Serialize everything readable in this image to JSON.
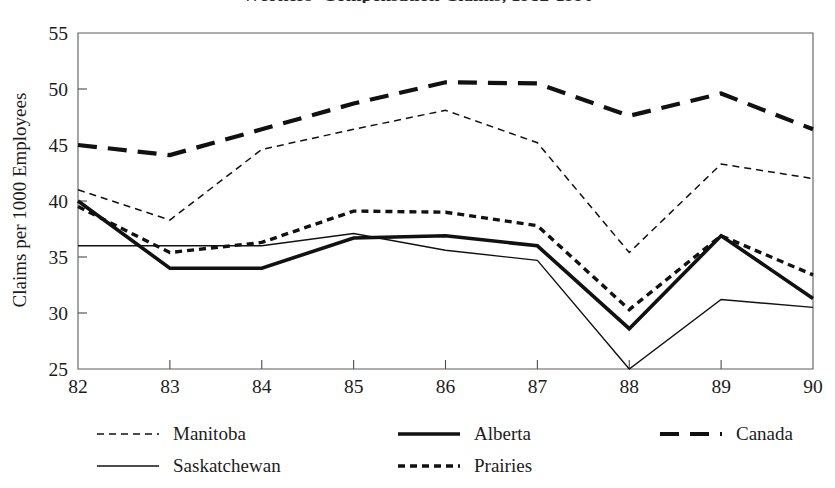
{
  "figure": {
    "title": "Workers' Compensation Claims, 1982-1990",
    "title_visible": "partially cropped at top edge",
    "background_color": "#ffffff",
    "ink_color": "#111111"
  },
  "axes": {
    "y_axis_title": "Claims per 1000 Employees",
    "y_ticks": [
      "25",
      "30",
      "35",
      "40",
      "45",
      "50",
      "55"
    ],
    "y_min": 25,
    "y_max": 55,
    "x_ticks": [
      "82",
      "83",
      "84",
      "85",
      "86",
      "87",
      "88",
      "89",
      "90"
    ],
    "x_axis_title": "",
    "grid": false
  },
  "legend": {
    "position": "below-plot",
    "rows": [
      [
        {
          "label": "Manitoba",
          "style": "fine-dotted"
        },
        {
          "label": "Alberta",
          "style": "thick-solid"
        },
        {
          "label": "Canada",
          "style": "thick-dashed"
        }
      ],
      [
        {
          "label": "Saskatchewan",
          "style": "thin-solid"
        },
        {
          "label": "Prairies",
          "style": "medium-dotted"
        },
        {
          "label": "",
          "style": "none"
        }
      ]
    ]
  },
  "chart_data": {
    "type": "line",
    "title": "Workers' Compensation Claims, 1982-1990",
    "xlabel": "",
    "ylabel": "Claims per 1000 Employees",
    "categories": [
      "82",
      "83",
      "84",
      "85",
      "86",
      "87",
      "88",
      "89",
      "90"
    ],
    "x": [
      82,
      83,
      84,
      85,
      86,
      87,
      88,
      89,
      90
    ],
    "ylim": [
      25,
      55
    ],
    "xlim": [
      82,
      90
    ],
    "grid": false,
    "legend_position": "below",
    "series": [
      {
        "name": "Canada",
        "style": "thick-dashed",
        "color": "#111111",
        "values": [
          45.0,
          44.1,
          46.4,
          48.7,
          50.6,
          50.5,
          47.6,
          49.6,
          46.4
        ]
      },
      {
        "name": "Manitoba",
        "style": "fine-dotted",
        "color": "#111111",
        "values": [
          41.0,
          38.3,
          44.6,
          46.4,
          48.1,
          45.2,
          35.4,
          43.3,
          42.0
        ]
      },
      {
        "name": "Prairies",
        "style": "medium-dotted",
        "color": "#111111",
        "values": [
          39.5,
          35.4,
          36.3,
          39.1,
          39.0,
          37.8,
          30.3,
          36.9,
          33.4
        ]
      },
      {
        "name": "Alberta",
        "style": "thick-solid",
        "color": "#111111",
        "values": [
          40.0,
          34.0,
          34.0,
          36.7,
          36.9,
          36.0,
          28.6,
          36.9,
          31.3
        ]
      },
      {
        "name": "Saskatchewan",
        "style": "thin-solid",
        "color": "#111111",
        "values": [
          36.0,
          36.0,
          36.0,
          37.1,
          35.6,
          34.7,
          25.0,
          31.2,
          30.5
        ]
      }
    ]
  }
}
